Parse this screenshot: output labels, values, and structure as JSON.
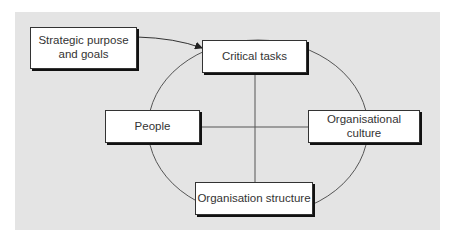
{
  "diagram": {
    "nodes": {
      "strategic": {
        "label_line1": "Strategic purpose",
        "label_line2": "and goals"
      },
      "critical_tasks": {
        "label": "Critical tasks"
      },
      "people": {
        "label": "People"
      },
      "organisational_culture": {
        "label": "Organisational culture"
      },
      "organisation_structure": {
        "label": "Organisation structure"
      }
    },
    "edges": [
      {
        "from": "Strategic purpose and goals",
        "to": "Critical tasks",
        "type": "arrow"
      },
      {
        "from": "Critical tasks",
        "to": "Organisation structure",
        "type": "line"
      },
      {
        "from": "People",
        "to": "Organisational culture",
        "type": "line"
      }
    ],
    "colors": {
      "background": "#e4e4e4",
      "box": "#ffffff",
      "line": "#444444"
    }
  }
}
